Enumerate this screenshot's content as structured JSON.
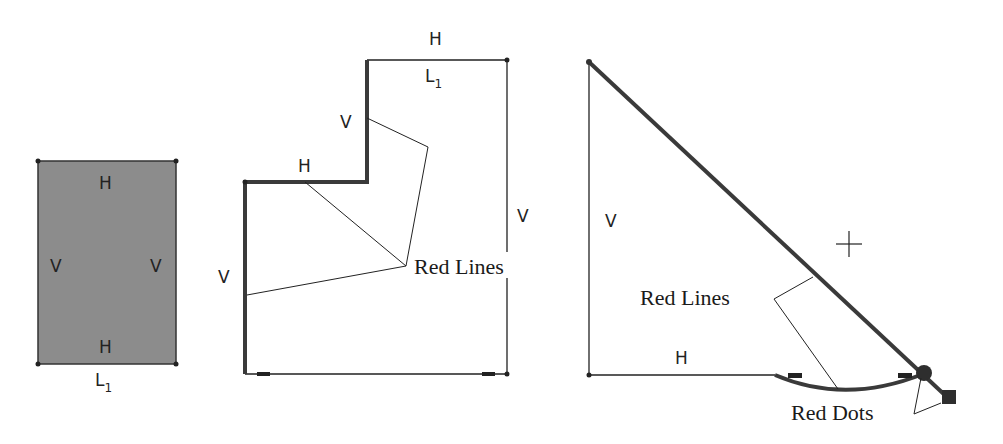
{
  "figure": {
    "panels": [
      {
        "id": "rectangle",
        "labels": {
          "top": "H",
          "bottom": "H",
          "left": "V",
          "right": "V",
          "dimension": "L",
          "dimension_sub": "1"
        }
      },
      {
        "id": "stepped-profile",
        "labels": {
          "top": "H",
          "top_dimension": "L",
          "top_dimension_sub": "1",
          "step_h": "H",
          "step_v": "V",
          "left_v": "V",
          "right_v": "V",
          "callout": "Red Lines"
        }
      },
      {
        "id": "triangle-arc",
        "labels": {
          "left_v": "V",
          "bottom_h": "H",
          "callout_lines": "Red Lines",
          "callout_dots": "Red Dots"
        }
      }
    ],
    "colors": {
      "line": "#222222",
      "fill": "#8c8c8c",
      "heavy": "#3a3a3a"
    }
  }
}
